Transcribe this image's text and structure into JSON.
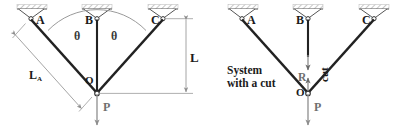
{
  "figure": {
    "type": "engineering-statics-diagram",
    "colors": {
      "bar": "#222222",
      "dimension": "#9a9a9a",
      "support_fill": "#ffffff",
      "hatch": "#b9b9b9",
      "label": "#1b1b1b",
      "gray_label": "#6f6f6f",
      "background": "#ffffff"
    }
  },
  "left_diagram": {
    "name": "intact-system",
    "supports": [
      {
        "id": "A",
        "label": "A",
        "label_side": "right"
      },
      {
        "id": "B",
        "label": "B",
        "label_side": "left"
      },
      {
        "id": "C",
        "label": "C",
        "label_side": "left"
      }
    ],
    "joint_label": "O",
    "load_label": "P",
    "angles": [
      {
        "label": "θ",
        "between": "AO and BO"
      },
      {
        "label": "θ",
        "between": "BO and CO"
      }
    ],
    "dimensions": [
      {
        "name": "length-of-bar-A",
        "label": "L",
        "subscript": "A",
        "orientation": "diagonal"
      },
      {
        "name": "vertical-length",
        "label": "L",
        "subscript": "",
        "orientation": "vertical"
      }
    ]
  },
  "right_diagram": {
    "name": "system-with-a-cut",
    "supports": [
      {
        "id": "A",
        "label": "A",
        "label_side": "right"
      },
      {
        "id": "B",
        "label": "B",
        "label_side": "left"
      },
      {
        "id": "C",
        "label": "C",
        "label_side": "left"
      }
    ],
    "joint_label": "O",
    "load_label": "P",
    "caption_line1": "System",
    "caption_line2": "with a cut",
    "cut_label": "cut",
    "reaction_label": "R"
  }
}
